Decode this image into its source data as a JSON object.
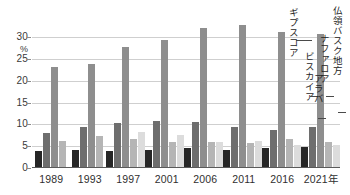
{
  "chart_data": {
    "type": "bar",
    "title": "",
    "subtitle": "",
    "xlabel": "",
    "ylabel": "%",
    "ylim": [
      0,
      34
    ],
    "yticks": [
      0,
      5,
      10,
      15,
      20,
      25,
      30
    ],
    "ytick_labels": [
      "0",
      "5",
      "10",
      "15",
      "20",
      "25",
      "30"
    ],
    "grid": true,
    "legend_position": "annotations-right",
    "categories": [
      "1989",
      "1993",
      "1997",
      "2001",
      "2006",
      "2011",
      "2016",
      "2021年"
    ],
    "series": [
      {
        "name": "アラバ",
        "color": "#262626",
        "values": [
          3.8,
          4.1,
          3.9,
          4.2,
          4.7,
          4.1,
          4.6,
          4.8
        ]
      },
      {
        "name": "ギプスコア",
        "color": "#6e6e6e",
        "values": [
          8.0,
          9.5,
          10.4,
          10.7,
          10.6,
          9.5,
          8.8,
          9.5
        ]
      },
      {
        "name": "ビスカイア",
        "color": "#8e8e8e",
        "values": [
          23.1,
          23.8,
          27.9,
          29.5,
          32.1,
          32.8,
          31.2,
          30.7
        ]
      },
      {
        "name": "ナファロア",
        "color": "#b5b5b5",
        "values": [
          6.3,
          7.4,
          6.7,
          5.9,
          5.9,
          5.7,
          6.7,
          6.0
        ]
      },
      {
        "name": "仏領バスク地方",
        "color": "#dcdcdc",
        "values": [
          null,
          null,
          8.2,
          7.6,
          6.0,
          6.1,
          5.4,
          5.2
        ]
      }
    ],
    "annotations": [
      {
        "label": "ギプスコア",
        "series": "ギプスコア"
      },
      {
        "label": "ビスカイア",
        "series": "ビスカイア"
      },
      {
        "label": "アラバ",
        "series": "アラバ"
      },
      {
        "label": "ナファロア",
        "series": "ナファロア"
      },
      {
        "label": "仏領バスク地方",
        "series": "仏領バスク地方"
      }
    ]
  },
  "axis": {
    "unit_label": "%"
  }
}
